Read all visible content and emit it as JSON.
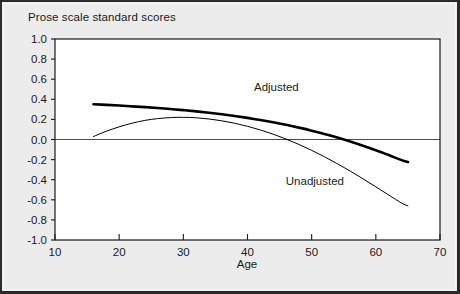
{
  "figure": {
    "background_color": "#ececec",
    "plot_background_color": "#ffffff",
    "border_color": "#2b2b2b"
  },
  "chart_data": {
    "type": "line",
    "title": "Prose scale standard scores",
    "xlabel": "Age",
    "ylabel": "",
    "xlim": [
      10,
      70
    ],
    "ylim": [
      -1.0,
      1.0
    ],
    "xticks": [
      10,
      20,
      30,
      40,
      50,
      60,
      70
    ],
    "xtick_labels": [
      "10",
      "20",
      "30",
      "40",
      "50",
      "60",
      "70"
    ],
    "yticks": [
      1.0,
      0.8,
      0.6,
      0.4,
      0.2,
      0.0,
      -0.2,
      -0.4,
      -0.6,
      -0.8,
      -1.0
    ],
    "ytick_labels": [
      "1.0",
      "0.8",
      "0.6",
      "0.4",
      "0.2",
      "0.0",
      "-0.2",
      "-0.4",
      "-0.6",
      "-0.8",
      "-1.0"
    ],
    "grid": false,
    "zero_line": true,
    "legend_position": "inline-annotations",
    "series": [
      {
        "name": "Adjusted",
        "style": "thick",
        "color": "#000000",
        "line_width": 2.6,
        "label_x": 44.5,
        "label_y": 0.48,
        "x": [
          16,
          18,
          20,
          22,
          24,
          26,
          28,
          30,
          32,
          34,
          36,
          38,
          40,
          42,
          44,
          46,
          48,
          50,
          52,
          54,
          56,
          58,
          60,
          62,
          64,
          65
        ],
        "y": [
          0.35,
          0.345,
          0.338,
          0.33,
          0.322,
          0.313,
          0.303,
          0.292,
          0.28,
          0.266,
          0.251,
          0.234,
          0.215,
          0.194,
          0.171,
          0.146,
          0.118,
          0.088,
          0.055,
          0.019,
          -0.02,
          -0.062,
          -0.107,
          -0.155,
          -0.205,
          -0.225
        ]
      },
      {
        "name": "Unadjusted",
        "style": "thin",
        "color": "#000000",
        "line_width": 1.0,
        "label_x": 50.5,
        "label_y": -0.45,
        "x": [
          16,
          18,
          20,
          22,
          24,
          26,
          28,
          30,
          32,
          34,
          36,
          38,
          40,
          42,
          44,
          46,
          48,
          50,
          52,
          54,
          56,
          58,
          60,
          62,
          64,
          65
        ],
        "y": [
          0.03,
          0.082,
          0.126,
          0.162,
          0.19,
          0.208,
          0.218,
          0.221,
          0.216,
          0.204,
          0.186,
          0.162,
          0.131,
          0.095,
          0.053,
          0.005,
          -0.049,
          -0.108,
          -0.172,
          -0.241,
          -0.314,
          -0.391,
          -0.471,
          -0.552,
          -0.632,
          -0.66
        ]
      }
    ],
    "annotations": [
      {
        "text": "Adjusted",
        "x": 44.5,
        "y": 0.48
      },
      {
        "text": "Unadjusted",
        "x": 50.5,
        "y": -0.45
      }
    ]
  }
}
